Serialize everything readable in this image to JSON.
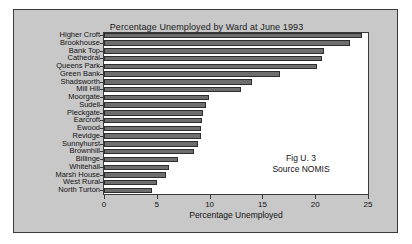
{
  "figure": {
    "title": "Percentage Unemployed by Ward at June 1993",
    "annotation_line1": "Fig U. 3",
    "annotation_line2": "Source NOMIS",
    "panel_color": "#c8c8c8",
    "plot_background": "#ffffff",
    "bar_color": "#6e6e6e",
    "bar_edge_color": "#2e2e2e",
    "border_color": "#3a3a3a"
  },
  "chart_data": {
    "type": "bar",
    "orientation": "horizontal",
    "title": "Percentage Unemployed by Ward at June 1993",
    "xlabel": "Percentage Unemployed",
    "ylabel": "",
    "xlim": [
      0,
      25
    ],
    "xticks": [
      0,
      5,
      10,
      15,
      20,
      25
    ],
    "xtick_labels": [
      "0",
      "5",
      "10",
      "15",
      "20",
      "25"
    ],
    "grid": false,
    "legend": false,
    "annotations": [
      "Fig U. 3",
      "Source NOMIS"
    ],
    "categories": [
      "Higher Croft",
      "Brookhouse",
      "Bank Top",
      "Cathedral",
      "Queens Park",
      "Green Bank",
      "Shadsworth",
      "Mill Hill",
      "Moorgate",
      "Sudell",
      "Pleckgate",
      "Earcroft",
      "Ewood",
      "Revidge",
      "Sunnyhurst",
      "Brownhill",
      "Billinge",
      "Whitehall",
      "Marsh House",
      "West Rural",
      "North Turton"
    ],
    "values": [
      24.4,
      23.3,
      20.8,
      20.6,
      20.2,
      16.7,
      14.0,
      13.0,
      9.9,
      9.7,
      9.4,
      9.3,
      9.2,
      9.2,
      8.9,
      8.5,
      7.0,
      6.2,
      5.9,
      5.0,
      4.5
    ]
  }
}
